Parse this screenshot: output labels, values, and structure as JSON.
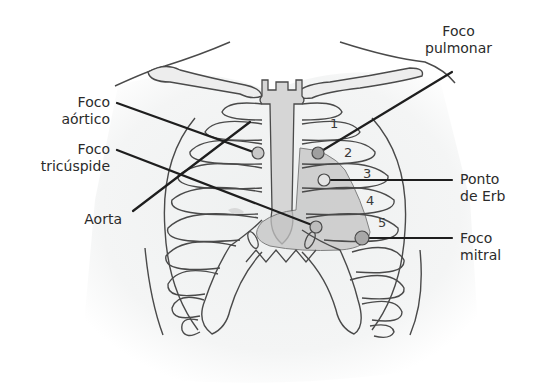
{
  "diagram": {
    "colors": {
      "outline": "#4a4a4a",
      "leader_line": "#1e1e1e",
      "sternum_fill": "#d6d6d6",
      "heart_fill": "#c4c4c4",
      "focus_point": "#b5b5b5",
      "skin_shade": "#f1f2f2",
      "text": "#2b2b2b"
    },
    "labels": {
      "foco_aortico": {
        "line1": "Foco",
        "line2": "aórtico"
      },
      "foco_tricuspide": {
        "line1": "Foco",
        "line2": "tricúspide"
      },
      "aorta": {
        "line1": "Aorta"
      },
      "foco_pulmonar": {
        "line1": "Foco",
        "line2": "pulmonar"
      },
      "ponto_de_erb": {
        "line1": "Ponto",
        "line2": "de Erb"
      },
      "foco_mitral": {
        "line1": "Foco",
        "line2": "mitral"
      }
    },
    "intercostal_numbers": [
      "1",
      "2",
      "3",
      "4",
      "5"
    ]
  }
}
